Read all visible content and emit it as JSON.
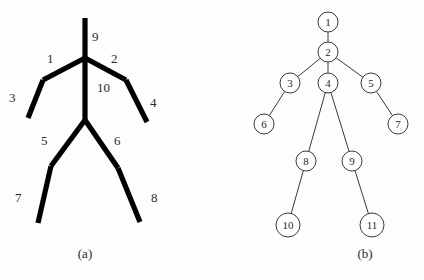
{
  "figure": {
    "panels": [
      {
        "id": "a",
        "caption": "(a)",
        "type": "skeleton-stick-figure",
        "description": "Human body part model with ten labelled limb segments",
        "segment_labels": [
          {
            "id": "1",
            "text": "1",
            "x": 47,
            "y": 52,
            "segment": "left-upper-arm"
          },
          {
            "id": "2",
            "text": "2",
            "x": 111,
            "y": 52,
            "segment": "right-upper-arm"
          },
          {
            "id": "3",
            "text": "3",
            "x": 9,
            "y": 91,
            "segment": "left-forearm"
          },
          {
            "id": "4",
            "text": "4",
            "x": 150,
            "y": 96,
            "segment": "right-forearm"
          },
          {
            "id": "5",
            "text": "5",
            "x": 41,
            "y": 134,
            "segment": "left-thigh"
          },
          {
            "id": "6",
            "text": "6",
            "x": 114,
            "y": 134,
            "segment": "right-thigh"
          },
          {
            "id": "7",
            "text": "7",
            "x": 15,
            "y": 191,
            "segment": "left-shank"
          },
          {
            "id": "8",
            "text": "8",
            "x": 151,
            "y": 191,
            "segment": "right-shank"
          },
          {
            "id": "9",
            "text": "9",
            "x": 92,
            "y": 30,
            "segment": "head-neck"
          },
          {
            "id": "10",
            "text": "10",
            "x": 97,
            "y": 81,
            "segment": "torso"
          }
        ],
        "bones": [
          {
            "name": "head-neck",
            "points": "85,18 85,58"
          },
          {
            "name": "torso",
            "points": "85,58 85,120"
          },
          {
            "name": "left-upper-arm",
            "points": "85,58 43,80"
          },
          {
            "name": "left-forearm",
            "points": "43,80 28,118"
          },
          {
            "name": "right-upper-arm",
            "points": "85,58 126,80"
          },
          {
            "name": "right-forearm",
            "points": "126,80 147,122"
          },
          {
            "name": "left-thigh",
            "points": "85,120 51,166"
          },
          {
            "name": "left-shank",
            "points": "51,166 38,223"
          },
          {
            "name": "right-thigh",
            "points": "85,120 118,168"
          },
          {
            "name": "right-shank",
            "points": "118,168 140,222"
          }
        ]
      },
      {
        "id": "b",
        "caption": "(b)",
        "type": "tree-graph",
        "description": "Tree representation of the body part model with eleven numbered nodes",
        "nodes": [
          {
            "id": 1,
            "label": "1",
            "x": 116,
            "y": 22,
            "r": 10
          },
          {
            "id": 2,
            "label": "2",
            "x": 116,
            "y": 52,
            "r": 10
          },
          {
            "id": 3,
            "label": "3",
            "x": 78,
            "y": 83,
            "r": 10
          },
          {
            "id": 4,
            "label": "4",
            "x": 116,
            "y": 83,
            "r": 10
          },
          {
            "id": 5,
            "label": "5",
            "x": 159,
            "y": 83,
            "r": 10
          },
          {
            "id": 6,
            "label": "6",
            "x": 52,
            "y": 124,
            "r": 10
          },
          {
            "id": 7,
            "label": "7",
            "x": 186,
            "y": 124,
            "r": 10
          },
          {
            "id": 8,
            "label": "8",
            "x": 94,
            "y": 161,
            "r": 10
          },
          {
            "id": 9,
            "label": "9",
            "x": 140,
            "y": 161,
            "r": 10
          },
          {
            "id": 10,
            "label": "10",
            "x": 76,
            "y": 225,
            "r": 12
          },
          {
            "id": 11,
            "label": "11",
            "x": 160,
            "y": 225,
            "r": 12
          }
        ],
        "edges": [
          {
            "from": 1,
            "to": 2
          },
          {
            "from": 2,
            "to": 3
          },
          {
            "from": 2,
            "to": 4
          },
          {
            "from": 2,
            "to": 5
          },
          {
            "from": 3,
            "to": 6
          },
          {
            "from": 5,
            "to": 7
          },
          {
            "from": 4,
            "to": 8
          },
          {
            "from": 4,
            "to": 9
          },
          {
            "from": 8,
            "to": 10
          },
          {
            "from": 9,
            "to": 11
          }
        ]
      }
    ],
    "colors": {
      "bone_stroke": "#000000",
      "tree_stroke": "#3a3a3a",
      "node_fill": "#ffffff",
      "text": "#1f1f1f",
      "background": "#fdfdfd"
    }
  }
}
